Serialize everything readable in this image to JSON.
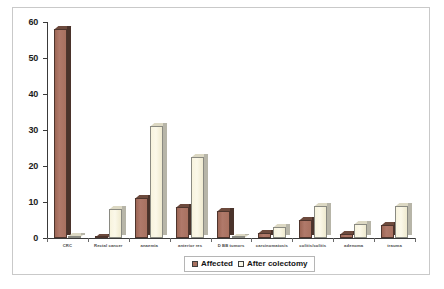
{
  "chart_data": {
    "type": "bar",
    "title": "",
    "subtitle": "",
    "xlabel": "",
    "ylabel": "",
    "ylim": [
      0,
      60
    ],
    "ytick_values": [
      0,
      10,
      20,
      30,
      40,
      50,
      60
    ],
    "ytick_labels": [
      "0",
      "10",
      "20",
      "30",
      "40",
      "50",
      "60"
    ],
    "grid": false,
    "legend_position": "bottom-center",
    "categories": [
      "CRC",
      "Rectal cancer",
      "anaemia",
      "anterior res",
      "D BB tumors",
      "carcinomatosis",
      "colitis/colitis",
      "adenoma",
      "trauma"
    ],
    "series": [
      {
        "name": "Affected",
        "color": "#a87160",
        "values": [
          58,
          0.4,
          11,
          8.5,
          7.5,
          1.5,
          5,
          1,
          3.5
        ]
      },
      {
        "name": "After colectomy",
        "color": "#faf7e6",
        "values": [
          0.5,
          8,
          31,
          22.5,
          0.4,
          3,
          9,
          4,
          9
        ]
      }
    ],
    "legend": [
      "Affected",
      "After colectomy"
    ]
  },
  "legend": {
    "affected_label": "Affected",
    "after_label": "After colectomy"
  },
  "colors": {
    "affected": "#a87160",
    "after": "#faf7e6",
    "axis": "#3a3a3a",
    "frame": "#c9c9c9"
  }
}
